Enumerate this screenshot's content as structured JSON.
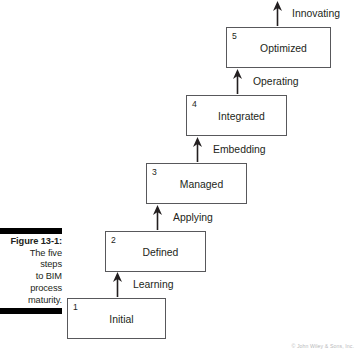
{
  "figure": {
    "caption_title": "Figure 13-1:",
    "caption_lines": [
      "The five",
      "steps",
      "to BIM",
      "process",
      "maturity."
    ],
    "credit": "© John Wiley & Sons, Inc."
  },
  "diagram": {
    "type": "staircase-process",
    "orientation": "ascending-left-to-right",
    "stages": [
      {
        "number": "1",
        "label": "Initial"
      },
      {
        "number": "2",
        "label": "Defined"
      },
      {
        "number": "3",
        "label": "Managed"
      },
      {
        "number": "4",
        "label": "Integrated"
      },
      {
        "number": "5",
        "label": "Optimized"
      }
    ],
    "transitions": [
      {
        "label": "Learning",
        "from": "Initial",
        "to": "Defined"
      },
      {
        "label": "Applying",
        "from": "Defined",
        "to": "Managed"
      },
      {
        "label": "Embedding",
        "from": "Managed",
        "to": "Integrated"
      },
      {
        "label": "Operating",
        "from": "Integrated",
        "to": "Optimized"
      },
      {
        "label": "Innovating",
        "from": "Optimized",
        "to": ""
      }
    ],
    "colors": {
      "box_border": "#58585b",
      "box_fill": "#ffffff",
      "text": "#231f20",
      "arrow": "#231f20",
      "caption_bar": "#000000",
      "background": "#ffffff"
    }
  }
}
